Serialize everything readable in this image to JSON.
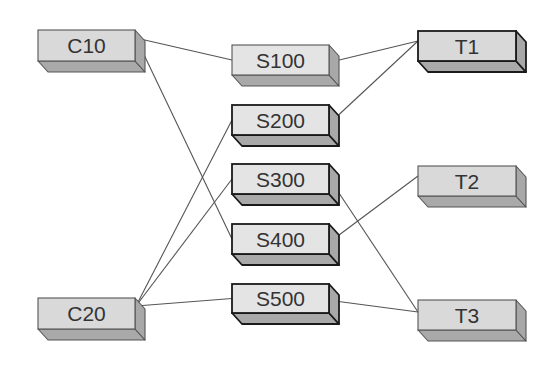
{
  "diagram": {
    "type": "network-mapping",
    "colors": {
      "front_face": "#d9d9d9",
      "front_face_s": "#e4e4e4",
      "top_face": "#bdbdbd",
      "side_face": "#a8a8a8",
      "bottom_face": "#a9a9a9",
      "edge": "#555555",
      "border_thin": "#555555",
      "border_thick": "#1a1a1a",
      "label": "#333333"
    },
    "nodes": [
      {
        "id": "C10",
        "label": "C10",
        "group": "C",
        "x": 38,
        "y": 30,
        "w": 97,
        "h": 31,
        "thick": false
      },
      {
        "id": "C20",
        "label": "C20",
        "group": "C",
        "x": 38,
        "y": 298,
        "w": 97,
        "h": 31,
        "thick": false
      },
      {
        "id": "S100",
        "label": "S100",
        "group": "S",
        "x": 232,
        "y": 45,
        "w": 97,
        "h": 30,
        "thick": false
      },
      {
        "id": "S200",
        "label": "S200",
        "group": "S",
        "x": 232,
        "y": 105,
        "w": 97,
        "h": 30,
        "thick": true
      },
      {
        "id": "S300",
        "label": "S300",
        "group": "S",
        "x": 232,
        "y": 164,
        "w": 97,
        "h": 30,
        "thick": true
      },
      {
        "id": "S400",
        "label": "S400",
        "group": "S",
        "x": 232,
        "y": 224,
        "w": 97,
        "h": 30,
        "thick": true
      },
      {
        "id": "S500",
        "label": "S500",
        "group": "S",
        "x": 232,
        "y": 284,
        "w": 97,
        "h": 29,
        "thick": true
      },
      {
        "id": "T1",
        "label": "T1",
        "group": "T",
        "x": 418,
        "y": 31,
        "w": 98,
        "h": 30,
        "thick": true
      },
      {
        "id": "T2",
        "label": "T2",
        "group": "T",
        "x": 418,
        "y": 166,
        "w": 98,
        "h": 30,
        "thick": false
      },
      {
        "id": "T3",
        "label": "T3",
        "group": "T",
        "x": 418,
        "y": 300,
        "w": 98,
        "h": 30,
        "thick": false
      }
    ],
    "edges": [
      {
        "from": "C10",
        "to": "S100"
      },
      {
        "from": "C10",
        "to": "S400"
      },
      {
        "from": "C20",
        "to": "S200"
      },
      {
        "from": "C20",
        "to": "S300"
      },
      {
        "from": "C20",
        "to": "S500"
      },
      {
        "from": "S100",
        "to": "T1"
      },
      {
        "from": "S200",
        "to": "T1"
      },
      {
        "from": "S400",
        "to": "T2"
      },
      {
        "from": "S300",
        "to": "T3"
      },
      {
        "from": "S500",
        "to": "T3"
      }
    ],
    "depth": {
      "dx": 10,
      "dy": 11
    }
  }
}
